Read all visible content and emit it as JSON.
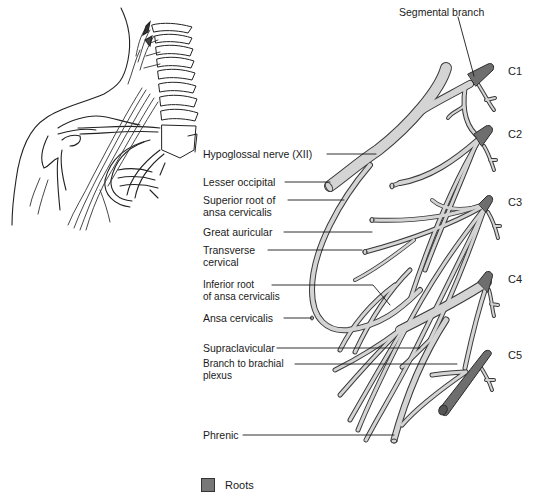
{
  "diagram": {
    "colors": {
      "nerve_fill": "#d4d4d4",
      "nerve_outline": "#3a3a3a",
      "root_fill": "#6e6e6e",
      "leader_line": "#1a1a1a",
      "background": "#ffffff"
    },
    "labels": [
      {
        "id": "segmental-branch",
        "text": "Segmental branch",
        "x": 399,
        "y": 6
      },
      {
        "id": "hypoglossal",
        "text": "Hypoglossal nerve (XII)",
        "x": 203,
        "y": 148
      },
      {
        "id": "lesser-occipital",
        "text": "Lesser occipital",
        "x": 203,
        "y": 176
      },
      {
        "id": "superior-root",
        "text": "Superior root of\nansa cervicalis",
        "x": 203,
        "y": 194
      },
      {
        "id": "great-auricular",
        "text": "Great auricular",
        "x": 203,
        "y": 226
      },
      {
        "id": "transverse-cervical",
        "text": "Transverse\ncervical",
        "x": 203,
        "y": 244
      },
      {
        "id": "inferior-root",
        "text": "Inferior root\nof ansa cervicalis",
        "x": 203,
        "y": 283
      },
      {
        "id": "ansa-cervicalis",
        "text": "Ansa cervicalis",
        "x": 203,
        "y": 311
      },
      {
        "id": "supraclavicular",
        "text": "Supraclavicular",
        "x": 203,
        "y": 341
      },
      {
        "id": "branch-brachial",
        "text": "Branch to brachial\nplexus",
        "x": 203,
        "y": 359
      },
      {
        "id": "phrenic",
        "text": "Phrenic",
        "x": 203,
        "y": 428
      }
    ],
    "roots": [
      {
        "id": "c1",
        "text": "C1",
        "x": 508,
        "y": 65
      },
      {
        "id": "c2",
        "text": "C2",
        "x": 508,
        "y": 128
      },
      {
        "id": "c3",
        "text": "C3",
        "x": 508,
        "y": 196
      },
      {
        "id": "c4",
        "text": "C4",
        "x": 508,
        "y": 273
      },
      {
        "id": "c5",
        "text": "C5",
        "x": 508,
        "y": 349
      }
    ],
    "legend": {
      "swatch_label": "Roots"
    }
  }
}
